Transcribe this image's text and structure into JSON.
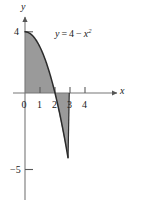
{
  "figure": {
    "name": "area-between-curve-and-axis",
    "axis_labels": {
      "x": "x",
      "y": "y"
    },
    "equation_label": {
      "lhs": "y",
      "equals": "=",
      "constant": "4",
      "minus": "−",
      "variable": "x",
      "exponent": "2",
      "full": "y = 4 − x²"
    },
    "origin_label": "0",
    "x_ticks": [
      {
        "value": 1,
        "label": "1"
      },
      {
        "value": 2,
        "label": "2"
      },
      {
        "value": 3,
        "label": "3"
      },
      {
        "value": 4,
        "label": "4"
      }
    ],
    "y_ticks": [
      {
        "value": 4,
        "label": "4"
      },
      {
        "value": -5,
        "label": "−5"
      }
    ],
    "colors": {
      "shade": "#9a9a9a",
      "curve": "#2b2b2b",
      "axis": "#6f6f6f",
      "text": "#1a1a1a",
      "background": "#ffffff"
    }
  },
  "chart_data": {
    "type": "line",
    "title": "",
    "subtitle": "",
    "xlabel": "x",
    "ylabel": "y",
    "xlim": [
      -0.6,
      5.1
    ],
    "ylim": [
      -5.6,
      4.9
    ],
    "grid": false,
    "legend": "none",
    "annotations": [
      {
        "text": "y = 4 − x²",
        "x": 1.55,
        "y": 3.1
      }
    ],
    "xticks": [
      0,
      1,
      2,
      3,
      4
    ],
    "xticklabels": [
      "0",
      "1",
      "2",
      "3",
      "4"
    ],
    "yticks": [
      4,
      -5
    ],
    "yticklabels": [
      "4",
      "−5"
    ],
    "series": [
      {
        "name": "y = 4 - x^2",
        "equation": "y = 4 - x^2",
        "x": [
          0,
          0.2,
          0.4,
          0.6,
          0.8,
          1.0,
          1.2,
          1.4,
          1.6,
          1.8,
          2.0,
          2.2,
          2.4,
          2.6,
          2.8,
          3.0
        ],
        "y": [
          4.0,
          3.96,
          3.84,
          3.64,
          3.36,
          3.0,
          2.56,
          2.04,
          1.44,
          0.76,
          0.0,
          -0.84,
          -1.76,
          -2.76,
          -3.84,
          -5.0
        ]
      }
    ],
    "shaded_regions": [
      {
        "name": "positive-area",
        "from_x": 0,
        "to_x": 2,
        "between": [
          "y = 4 - x^2",
          "y = 0"
        ],
        "sign": "positive",
        "color": "#9a9a9a"
      },
      {
        "name": "negative-area",
        "from_x": 2,
        "to_x": 3,
        "between": [
          "y = 0",
          "y = 4 - x^2"
        ],
        "sign": "negative",
        "color": "#9a9a9a"
      }
    ]
  }
}
